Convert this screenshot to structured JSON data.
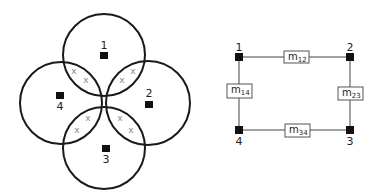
{
  "left_diagram": {
    "title": "",
    "circles": [
      {
        "id": "1",
        "cx": 104,
        "cy": 55,
        "r": 41
      },
      {
        "id": "2",
        "cx": 148,
        "cy": 103,
        "r": 42
      },
      {
        "id": "3",
        "cx": 104,
        "cy": 148,
        "r": 41
      },
      {
        "id": "4",
        "cx": 61,
        "cy": 103,
        "r": 41
      }
    ],
    "nodes": [
      {
        "label": "1",
        "x": 104,
        "y": 56,
        "lx": 104,
        "ly": 49
      },
      {
        "label": "2",
        "x": 149,
        "y": 104,
        "lx": 149,
        "ly": 97
      },
      {
        "label": "3",
        "x": 106,
        "y": 148,
        "lx": 106,
        "ly": 163
      },
      {
        "label": "4",
        "x": 60,
        "y": 95,
        "lx": 60,
        "ly": 110
      }
    ],
    "x_marks": [
      {
        "text": "x",
        "x": 74,
        "y": 74
      },
      {
        "text": "x",
        "x": 86,
        "y": 83
      },
      {
        "text": "x",
        "x": 133,
        "y": 74
      },
      {
        "text": "x",
        "x": 122,
        "y": 83
      },
      {
        "text": "x",
        "x": 88,
        "y": 121
      },
      {
        "text": "x",
        "x": 77,
        "y": 133
      },
      {
        "text": "x",
        "x": 120,
        "y": 121
      },
      {
        "text": "x",
        "x": 131,
        "y": 133
      }
    ]
  },
  "right_diagram": {
    "nodes": [
      {
        "label": "1",
        "x": 239,
        "y": 57
      },
      {
        "label": "2",
        "x": 350,
        "y": 57
      },
      {
        "label": "3",
        "x": 350,
        "y": 130
      },
      {
        "label": "4",
        "x": 239,
        "y": 130
      }
    ],
    "edges": [
      {
        "label_main": "m",
        "label_sub": "12"
      },
      {
        "label_main": "m",
        "label_sub": "23"
      },
      {
        "label_main": "m",
        "label_sub": "34"
      },
      {
        "label_main": "m",
        "label_sub": "14"
      }
    ]
  }
}
